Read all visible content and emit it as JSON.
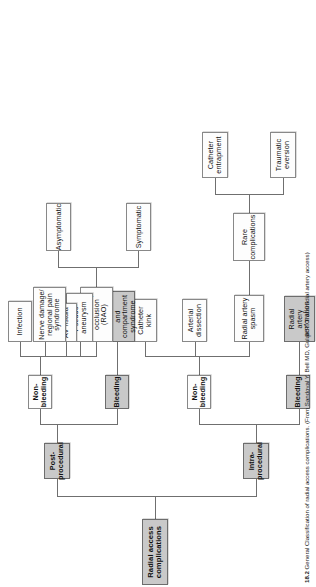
{
  "figure": {
    "number": "18.2",
    "caption": "General Classification of radial access complications. (From Sandoval Y, Bell MD, Gulati R. Transradial artery access)"
  },
  "diagram": {
    "type": "tree",
    "orientation": "rotated-90-ccw",
    "root": {
      "label": "Radial access complications",
      "style": "shaded-bold"
    },
    "branches": [
      {
        "label": "Intra-procedural",
        "style": "shaded-bold",
        "children": [
          {
            "label": "Bleeding",
            "style": "shaded-bold",
            "children": [
              {
                "label": "Radial artery perforation",
                "style": "shaded"
              }
            ]
          },
          {
            "label": "Non-bleeding",
            "style": "white-bold",
            "children": [
              {
                "label": "Radial artery spasm",
                "style": "white",
                "children": [
                  {
                    "label": "Rare complications",
                    "style": "white",
                    "children": [
                      {
                        "label": "Catheter entrapment",
                        "style": "white"
                      },
                      {
                        "label": "Traumatic eversion",
                        "style": "white"
                      }
                    ]
                  }
                ]
              },
              {
                "label": "Arterial dissection",
                "style": "white"
              },
              {
                "label": "Catheter kink",
                "style": "white"
              }
            ]
          }
        ]
      },
      {
        "label": "Post-procedural",
        "style": "shaded-bold",
        "children": [
          {
            "label": "Bleeding",
            "style": "shaded-bold",
            "children": [
              {
                "label": "Forearm hematoma and compartment syndrome",
                "style": "shaded"
              }
            ]
          },
          {
            "label": "Non-bleeding",
            "style": "white-bold",
            "children": [
              {
                "label": "Radial artery occlusion (RAO)",
                "style": "white",
                "children": [
                  {
                    "label": "Symptomatic",
                    "style": "white"
                  },
                  {
                    "label": "Asymptomatic",
                    "style": "white"
                  }
                ]
              },
              {
                "label": "Pseudo-aneurysm",
                "style": "white"
              },
              {
                "label": "AV fistula",
                "style": "white"
              },
              {
                "label": "Nerve damage/ regional pain syndrome",
                "style": "white"
              },
              {
                "label": "Infection",
                "style": "white"
              }
            ]
          }
        ]
      }
    ],
    "labels": {
      "root": "Radial access complications",
      "intra": "Intra-procedural",
      "post": "Post-procedural",
      "bleeding_intra": "Bleeding",
      "nonbleeding_intra": "Non-bleeding",
      "bleeding_post": "Bleeding",
      "nonbleeding_post": "Non-bleeding",
      "ra_perforation": "Radial artery perforation",
      "ra_spasm": "Radial artery spasm",
      "arterial_dissection": "Arterial dissection",
      "catheter_kink": "Catheter kink",
      "rare_complications": "Rare complications",
      "catheter_entrapment": "Catheter entrapment",
      "traumatic_eversion": "Traumatic eversion",
      "forearm_hematoma": "Forearm hematoma and compartment syndrome",
      "rao": "Radial artery occlusion (RAO)",
      "symptomatic": "Symptomatic",
      "asymptomatic": "Asymptomatic",
      "pseudoaneurysm": "Pseudo-aneurysm",
      "av_fistula": "AV fistula",
      "nerve_damage": "Nerve damage/ regional pain syndrome",
      "infection": "Infection"
    },
    "colors": {
      "shade_fill": "#c9c9c9",
      "white_fill": "#fdfdfd",
      "border": "#888888",
      "edge": "#6f6f6f",
      "text": "#111111"
    }
  }
}
